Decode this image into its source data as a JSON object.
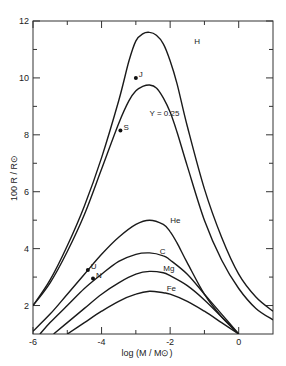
{
  "chart_data": {
    "type": "line",
    "title": "",
    "xlabel": "log (M / M⊙)",
    "ylabel": "100 R / R⊙",
    "xlim": [
      -6,
      1
    ],
    "ylim": [
      1,
      12
    ],
    "grid": false,
    "legend": "inline curve labels",
    "x_ticks": [
      -6,
      -4,
      -2,
      0
    ],
    "x_tick_labels": [
      "-6",
      "-4",
      "-2",
      "0"
    ],
    "x_minor_ticks": [
      -5,
      -3,
      -1
    ],
    "y_ticks": [
      2,
      4,
      6,
      8,
      10,
      12
    ],
    "y_tick_labels": [
      "2",
      "4",
      "6",
      "8",
      "10",
      "12"
    ],
    "y_minor_ticks": [
      3,
      5,
      7,
      9,
      11
    ],
    "series": [
      {
        "name": "H",
        "x": [
          -6.0,
          -5.5,
          -5.0,
          -4.5,
          -4.0,
          -3.5,
          -3.2,
          -3.0,
          -2.8,
          -2.6,
          -2.4,
          -2.2,
          -2.0,
          -1.8,
          -1.5,
          -1.0,
          -0.5,
          0.0,
          0.5,
          1.0
        ],
        "y": [
          2.0,
          2.9,
          4.1,
          5.5,
          7.2,
          9.2,
          10.6,
          11.3,
          11.55,
          11.6,
          11.5,
          11.2,
          10.6,
          9.8,
          8.3,
          6.1,
          4.4,
          3.1,
          2.3,
          1.8
        ]
      },
      {
        "name": "Y = 0.25",
        "x": [
          -6.0,
          -5.5,
          -5.0,
          -4.5,
          -4.0,
          -3.5,
          -3.2,
          -3.0,
          -2.8,
          -2.6,
          -2.4,
          -2.2,
          -2.0,
          -1.8,
          -1.5,
          -1.0,
          -0.5,
          0.0,
          0.5,
          1.0
        ],
        "y": [
          2.0,
          2.8,
          3.9,
          5.2,
          6.8,
          8.4,
          9.2,
          9.55,
          9.7,
          9.75,
          9.65,
          9.3,
          8.8,
          8.1,
          6.9,
          5.0,
          3.6,
          2.6,
          1.9,
          1.5
        ]
      },
      {
        "name": "He",
        "x": [
          -6.0,
          -5.5,
          -5.0,
          -4.5,
          -4.0,
          -3.5,
          -3.0,
          -2.6,
          -2.2,
          -2.0,
          -1.8,
          -1.5,
          -1.0,
          -0.5,
          0.0
        ],
        "y": [
          1.1,
          1.7,
          2.4,
          3.1,
          3.8,
          4.4,
          4.85,
          5.0,
          4.85,
          4.6,
          4.2,
          3.5,
          2.4,
          1.6,
          1.0
        ]
      },
      {
        "name": "C",
        "x": [
          -5.8,
          -5.5,
          -5.0,
          -4.5,
          -4.0,
          -3.5,
          -3.0,
          -2.6,
          -2.2,
          -2.0,
          -1.5,
          -1.0,
          -0.5,
          0.0
        ],
        "y": [
          1.0,
          1.4,
          2.0,
          2.6,
          3.1,
          3.55,
          3.8,
          3.85,
          3.75,
          3.6,
          3.1,
          2.4,
          1.7,
          1.0
        ]
      },
      {
        "name": "Mg",
        "x": [
          -5.4,
          -5.0,
          -4.5,
          -4.0,
          -3.5,
          -3.0,
          -2.6,
          -2.2,
          -2.0,
          -1.5,
          -1.0,
          -0.5,
          0.0
        ],
        "y": [
          1.0,
          1.4,
          1.9,
          2.4,
          2.8,
          3.1,
          3.2,
          3.15,
          3.05,
          2.7,
          2.2,
          1.6,
          1.0
        ]
      },
      {
        "name": "Fe",
        "x": [
          -5.0,
          -4.5,
          -4.0,
          -3.5,
          -3.0,
          -2.6,
          -2.2,
          -2.0,
          -1.5,
          -1.0,
          -0.5,
          0.0
        ],
        "y": [
          1.0,
          1.4,
          1.8,
          2.15,
          2.4,
          2.5,
          2.45,
          2.4,
          2.15,
          1.8,
          1.4,
          1.0
        ]
      }
    ],
    "points": [
      {
        "label": "J",
        "x": -3.0,
        "y": 10.0
      },
      {
        "label": "S",
        "x": -3.45,
        "y": 8.15
      },
      {
        "label": "U",
        "x": -4.4,
        "y": 3.25
      },
      {
        "label": "N",
        "x": -4.25,
        "y": 2.95
      }
    ],
    "annotations": [
      {
        "text": "H",
        "x": -1.3,
        "y": 11.2
      },
      {
        "text": "Y = 0.25",
        "x": -2.6,
        "y": 8.65
      },
      {
        "text": "He",
        "x": -2.0,
        "y": 4.9
      },
      {
        "text": "C",
        "x": -2.3,
        "y": 3.8
      },
      {
        "text": "Mg",
        "x": -2.2,
        "y": 3.2
      },
      {
        "text": "Fe",
        "x": -2.1,
        "y": 2.5
      }
    ]
  },
  "labels": {
    "ylabel": "100 R / R⊙",
    "xlabel": "log (M / M⊙)"
  }
}
